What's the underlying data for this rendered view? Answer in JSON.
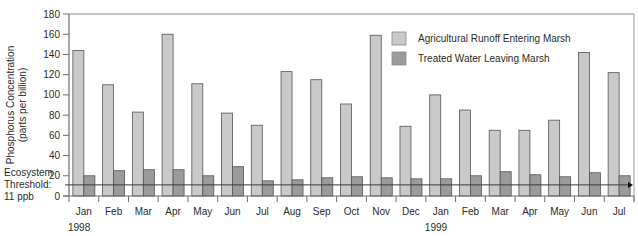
{
  "chart_data": {
    "type": "bar",
    "title": "",
    "xlabel": "",
    "ylabel": "Phosphorus Concentration (parts per billion)",
    "ylabel_lines": [
      "Phosphorus Concentration",
      "(parts per billion)"
    ],
    "ylim": [
      0,
      180
    ],
    "yticks": [
      0,
      20,
      40,
      60,
      80,
      100,
      120,
      140,
      160,
      180
    ],
    "grid": false,
    "legend_position": "upper right",
    "categories": [
      "Jan",
      "Feb",
      "Mar",
      "Apr",
      "May",
      "Jun",
      "Jul",
      "Aug",
      "Sep",
      "Oct",
      "Nov",
      "Dec",
      "Jan",
      "Feb",
      "Mar",
      "Apr",
      "May",
      "Jun",
      "Jul"
    ],
    "year_labels": [
      {
        "label": "1998",
        "category_index": 0
      },
      {
        "label": "1999",
        "category_index": 12
      }
    ],
    "series": [
      {
        "name": "Agricultural Runoff Entering Marsh",
        "color": "#c9c9c9",
        "values": [
          144,
          110,
          83,
          160,
          111,
          82,
          70,
          123,
          115,
          91,
          159,
          69,
          100,
          85,
          65,
          65,
          75,
          142,
          122
        ]
      },
      {
        "name": "Treated Water Leaving Marsh",
        "color": "#9b9b9b",
        "values": [
          20,
          25,
          26,
          26,
          20,
          29,
          15,
          16,
          18,
          19,
          18,
          17,
          17,
          20,
          24,
          21,
          19,
          23,
          20
        ]
      }
    ],
    "annotations": [
      {
        "type": "hline",
        "y": 11,
        "label_lines": [
          "Ecosystem",
          "Threshold:",
          "11 ppb"
        ]
      }
    ]
  },
  "colors": {
    "axis": "#6e6e6e",
    "bar_border": "#555555",
    "threshold_line": "#3a3a3a",
    "text": "#2b2b2b"
  }
}
